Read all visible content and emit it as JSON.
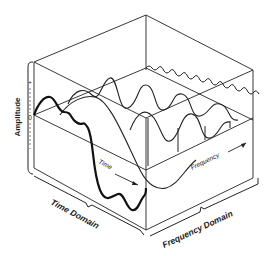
{
  "figure": {
    "type": "3d-box-diagram",
    "colors": {
      "ink": "#222222",
      "background": "#ffffff"
    }
  },
  "axes": {
    "amplitude": {
      "label": "Amplitude",
      "ticks": [
        "+",
        "0",
        "-"
      ]
    },
    "time": {
      "label": "Time",
      "arrow": true
    },
    "frequency": {
      "label": "Frequency",
      "arrow": true
    }
  },
  "domains": {
    "time_domain": {
      "label": "Time Domain"
    },
    "frequency_domain": {
      "label": "Frequency Domain"
    }
  }
}
